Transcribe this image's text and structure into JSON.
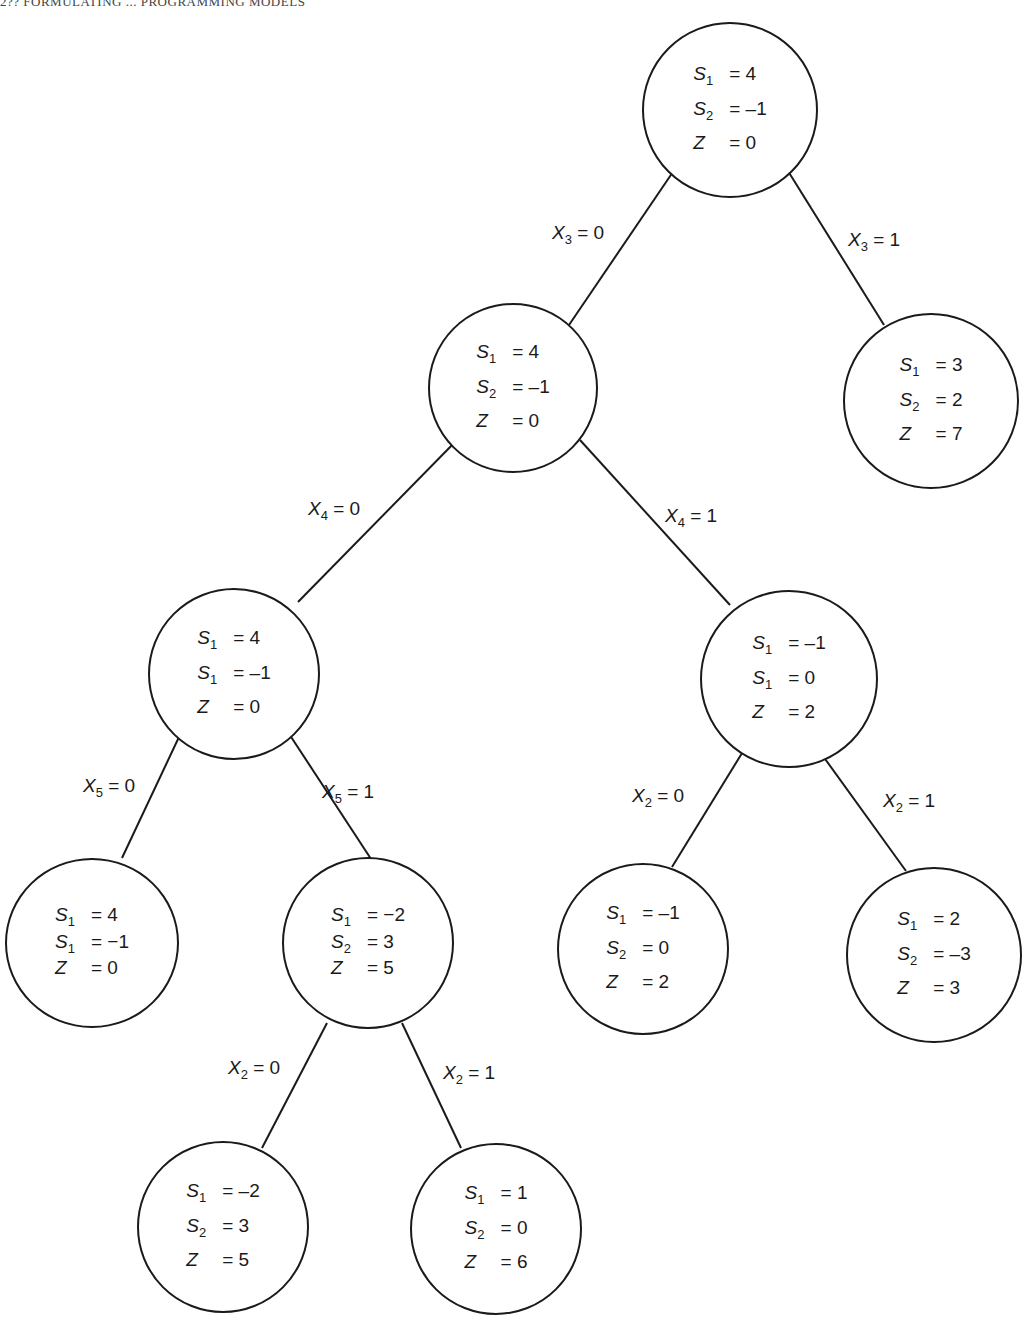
{
  "header": {
    "running_head": "2?? FORMULATING ... PROGRAMMING MODELS"
  },
  "tree": {
    "nodes": [
      {
        "id": "root",
        "lines": [
          {
            "v": "S",
            "sub": "1",
            "val": "= 4"
          },
          {
            "v": "S",
            "sub": "2",
            "val": "= –1"
          },
          {
            "v": "Z",
            "sub": "",
            "val": "= 0"
          }
        ]
      },
      {
        "id": "x3_0",
        "lines": [
          {
            "v": "S",
            "sub": "1",
            "val": "= 4"
          },
          {
            "v": "S",
            "sub": "2",
            "val": "= –1"
          },
          {
            "v": "Z",
            "sub": "",
            "val": "= 0"
          }
        ]
      },
      {
        "id": "x3_1",
        "lines": [
          {
            "v": "S",
            "sub": "1",
            "val": "= 3"
          },
          {
            "v": "S",
            "sub": "2",
            "val": "= 2"
          },
          {
            "v": "Z",
            "sub": "",
            "val": "= 7"
          }
        ]
      },
      {
        "id": "x4_0",
        "lines": [
          {
            "v": "S",
            "sub": "1",
            "val": "= 4"
          },
          {
            "v": "S",
            "sub": "1",
            "val": "= –1"
          },
          {
            "v": "Z",
            "sub": "",
            "val": "= 0"
          }
        ]
      },
      {
        "id": "x4_1",
        "lines": [
          {
            "v": "S",
            "sub": "1",
            "val": "= –1"
          },
          {
            "v": "S",
            "sub": "1",
            "val": "= 0"
          },
          {
            "v": "Z",
            "sub": "",
            "val": "= 2"
          }
        ]
      },
      {
        "id": "x5_0",
        "lines": [
          {
            "v": "S",
            "sub": "1",
            "val": "= 4"
          },
          {
            "v": "S",
            "sub": "1",
            "val": "= −1"
          },
          {
            "v": "Z",
            "sub": "",
            "val": "= 0"
          }
        ]
      },
      {
        "id": "x5_1",
        "lines": [
          {
            "v": "S",
            "sub": "1",
            "val": "= −2"
          },
          {
            "v": "S",
            "sub": "2",
            "val": "= 3"
          },
          {
            "v": "Z",
            "sub": "",
            "val": "= 5"
          }
        ]
      },
      {
        "id": "x4_1_x2_0",
        "lines": [
          {
            "v": "S",
            "sub": "1",
            "val": "= –1"
          },
          {
            "v": "S",
            "sub": "2",
            "val": "= 0"
          },
          {
            "v": "Z",
            "sub": "",
            "val": "= 2"
          }
        ]
      },
      {
        "id": "x4_1_x2_1",
        "lines": [
          {
            "v": "S",
            "sub": "1",
            "val": "= 2"
          },
          {
            "v": "S",
            "sub": "2",
            "val": "= –3"
          },
          {
            "v": "Z",
            "sub": "",
            "val": "= 3"
          }
        ]
      },
      {
        "id": "x5_1_x2_0",
        "lines": [
          {
            "v": "S",
            "sub": "1",
            "val": "= –2"
          },
          {
            "v": "S",
            "sub": "2",
            "val": "= 3"
          },
          {
            "v": "Z",
            "sub": "",
            "val": "= 5"
          }
        ]
      },
      {
        "id": "x5_1_x2_1",
        "lines": [
          {
            "v": "S",
            "sub": "1",
            "val": "= 1"
          },
          {
            "v": "S",
            "sub": "2",
            "val": "= 0"
          },
          {
            "v": "Z",
            "sub": "",
            "val": "= 6"
          }
        ]
      }
    ],
    "edges": [
      {
        "from": "root",
        "to": "x3_0",
        "label": {
          "v": "X",
          "sub": "3",
          "val": "= 0"
        }
      },
      {
        "from": "root",
        "to": "x3_1",
        "label": {
          "v": "X",
          "sub": "3",
          "val": "= 1"
        }
      },
      {
        "from": "x3_0",
        "to": "x4_0",
        "label": {
          "v": "X",
          "sub": "4",
          "val": "= 0"
        }
      },
      {
        "from": "x3_0",
        "to": "x4_1",
        "label": {
          "v": "X",
          "sub": "4",
          "val": "= 1"
        }
      },
      {
        "from": "x4_0",
        "to": "x5_0",
        "label": {
          "v": "X",
          "sub": "5",
          "val": "= 0"
        }
      },
      {
        "from": "x4_0",
        "to": "x5_1",
        "label": {
          "v": "X",
          "sub": "5",
          "val": "= 1"
        }
      },
      {
        "from": "x4_1",
        "to": "x4_1_x2_0",
        "label": {
          "v": "X",
          "sub": "2",
          "val": "= 0"
        }
      },
      {
        "from": "x4_1",
        "to": "x4_1_x2_1",
        "label": {
          "v": "X",
          "sub": "2",
          "val": "= 1"
        }
      },
      {
        "from": "x5_1",
        "to": "x5_1_x2_0",
        "label": {
          "v": "X",
          "sub": "2",
          "val": "= 0"
        }
      },
      {
        "from": "x5_1",
        "to": "x5_1_x2_1",
        "label": {
          "v": "X",
          "sub": "2",
          "val": "= 1"
        }
      }
    ]
  }
}
